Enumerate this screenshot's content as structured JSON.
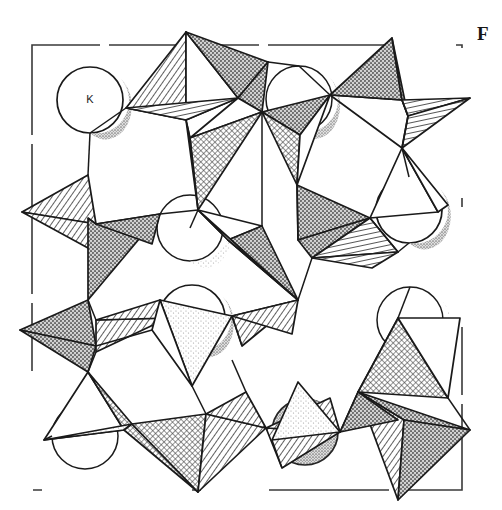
{
  "figure": {
    "letter": "F",
    "caption_text": "",
    "kind": "crystal-structure-polyhedral-diagram",
    "background_color": "#ffffff",
    "ink_color": "#1a1a1a"
  },
  "unit_cell": {
    "label": "unit-cell-outline",
    "style": "dashed",
    "color": "#3a3a3a",
    "x": 32,
    "y": 45,
    "width": 430,
    "height": 445
  },
  "legend": {
    "cation_symbol": "K",
    "cation_count_labelled": 4,
    "cation_count_partial": 4
  },
  "atoms": [
    {
      "symbol": "K",
      "label": "K",
      "cx": 90,
      "cy": 100,
      "r": 33,
      "labelled": true,
      "clipped": false
    },
    {
      "symbol": "K",
      "label": "K",
      "cx": 409,
      "cy": 210,
      "r": 33,
      "labelled": true,
      "clipped": false
    },
    {
      "symbol": "K",
      "label": "K",
      "cx": 192,
      "cy": 318,
      "r": 33,
      "labelled": true,
      "clipped": false
    },
    {
      "symbol": "K",
      "label": "K",
      "cx": 305,
      "cy": 432,
      "r": 33,
      "labelled": true,
      "clipped": false
    },
    {
      "symbol": "K",
      "label": "",
      "cx": 299,
      "cy": 99,
      "r": 33,
      "labelled": false,
      "clipped": true
    },
    {
      "symbol": "K",
      "label": "",
      "cx": 190,
      "cy": 228,
      "r": 33,
      "labelled": false,
      "clipped": true
    },
    {
      "symbol": "K",
      "label": "",
      "cx": 410,
      "cy": 320,
      "r": 33,
      "labelled": false,
      "clipped": true
    },
    {
      "symbol": "K",
      "label": "",
      "cx": 85,
      "cy": 436,
      "r": 33,
      "labelled": false,
      "clipped": true
    }
  ],
  "shading": {
    "face_light_hatch": "#ffffff",
    "face_dark_stipple": "#9a9a9a",
    "face_mid_crosshatch": "#b5b5b5",
    "face_blank": "#ffffff",
    "outline": "#1a1a1a",
    "sphere_fill": "#ffffff",
    "sphere_shadow": "#a8a8a8"
  },
  "tetrahedra": [
    {
      "id": "t1",
      "note": "upper-left-rim, hatched front face"
    },
    {
      "id": "t2",
      "note": "top-center, stippled right face"
    },
    {
      "id": "t3",
      "note": "top-right apex, dark stipple"
    },
    {
      "id": "t4",
      "note": "right-edge hatched wedge"
    },
    {
      "id": "t5",
      "note": "left-mid hatched wedge"
    },
    {
      "id": "t6",
      "note": "left-mid dark stipple triangle"
    },
    {
      "id": "t7",
      "note": "center crosshatch tetrahedron"
    },
    {
      "id": "t8",
      "note": "center-right stippled tetrahedron"
    },
    {
      "id": "t9",
      "note": "lower-left stipple triangle"
    },
    {
      "id": "t10",
      "note": "lower-left hatched tetrahedron"
    },
    {
      "id": "t11",
      "note": "bottom-left dark tetrahedron"
    },
    {
      "id": "t12",
      "note": "bottom-center hatched tetrahedron"
    },
    {
      "id": "t13",
      "note": "bottom-right crosshatch tetrahedron"
    },
    {
      "id": "t14",
      "note": "bottom-right stippled wedge"
    },
    {
      "id": "t15",
      "note": "right-mid crosshatch tetrahedron"
    },
    {
      "id": "t16",
      "note": "upper-center crosshatch tetrahedron"
    }
  ]
}
